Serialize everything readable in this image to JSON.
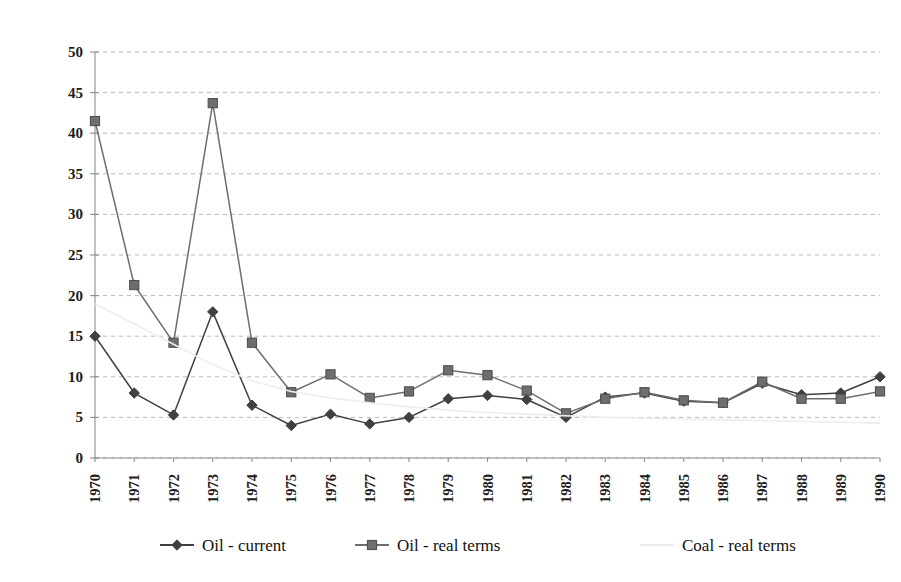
{
  "chart_data": {
    "type": "line",
    "title": "",
    "subtitle": "",
    "xlabel": "",
    "ylabel": "",
    "ylim": [
      0,
      50
    ],
    "ytick_step": 5,
    "yticks": [
      0,
      5,
      10,
      15,
      20,
      25,
      30,
      35,
      40,
      45,
      50
    ],
    "grid": true,
    "grid_style": "horizontal dashed",
    "legend_position": "bottom",
    "categories": [
      "1970",
      "1971",
      "1972",
      "1973",
      "1974",
      "1975",
      "1976",
      "1977",
      "1978",
      "1979",
      "1980",
      "1981",
      "1982",
      "1983",
      "1984",
      "1985",
      "1986",
      "1987",
      "1988",
      "1989",
      "1990"
    ],
    "series": [
      {
        "name": "Oil - current",
        "marker": "diamond",
        "color": "#404040",
        "values": [
          15.0,
          8.0,
          5.3,
          18.0,
          6.5,
          4.0,
          5.4,
          4.2,
          5.0,
          7.3,
          7.7,
          7.2,
          5.0,
          7.5,
          8.0,
          7.0,
          6.8,
          9.2,
          7.8,
          8.0,
          10.0
        ]
      },
      {
        "name": "Oil - real terms",
        "marker": "square",
        "color": "#6e6e6e",
        "values": [
          41.5,
          21.3,
          14.2,
          43.7,
          14.2,
          8.1,
          10.3,
          7.4,
          8.2,
          10.8,
          10.2,
          8.3,
          5.5,
          7.3,
          8.1,
          7.1,
          6.8,
          9.4,
          7.3,
          7.3,
          8.2
        ]
      },
      {
        "name": "Coal - real terms",
        "marker": "none",
        "color": "#ededed",
        "values": [
          19.0,
          16.5,
          14.0,
          11.5,
          9.5,
          8.2,
          7.4,
          6.8,
          6.3,
          5.9,
          5.6,
          5.4,
          5.2,
          5.0,
          4.9,
          4.8,
          4.7,
          4.6,
          4.5,
          4.4,
          4.3
        ]
      }
    ]
  },
  "axis": {
    "ytick_labels": [
      "50",
      "45",
      "40",
      "35",
      "30",
      "25",
      "20",
      "15",
      "10",
      "5",
      "0"
    ],
    "xtick_labels": [
      "1970",
      "1971",
      "1972",
      "1973",
      "1974",
      "1975",
      "1976",
      "1977",
      "1978",
      "1979",
      "1980",
      "1981",
      "1982",
      "1983",
      "1984",
      "1985",
      "1986",
      "1987",
      "1988",
      "1989",
      "1990"
    ]
  },
  "legend": {
    "items": [
      {
        "label": "Oil - current",
        "marker": "diamond-marker",
        "color": "#404040"
      },
      {
        "label": "Oil - real terms",
        "marker": "square-marker",
        "color": "#6e6e6e"
      },
      {
        "label": "Coal - real terms",
        "marker": "faint-line-marker",
        "color": "#ededed"
      }
    ]
  }
}
